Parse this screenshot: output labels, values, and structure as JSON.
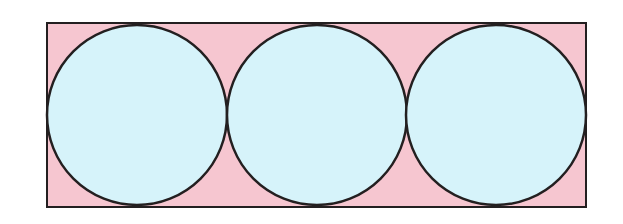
{
  "diagram": {
    "colors": {
      "background": "#ffffff",
      "rectangle_fill": "#f6c6d0",
      "circle_fill": "#d6f3fa",
      "stroke": "#231f20"
    },
    "rectangle": {
      "x": 47,
      "y": 23,
      "width": 539,
      "height": 184
    },
    "circles": [
      {
        "cx": 137,
        "cy": 115,
        "r": 90
      },
      {
        "cx": 317,
        "cy": 115,
        "r": 90
      },
      {
        "cx": 496,
        "cy": 115,
        "r": 90
      }
    ]
  }
}
